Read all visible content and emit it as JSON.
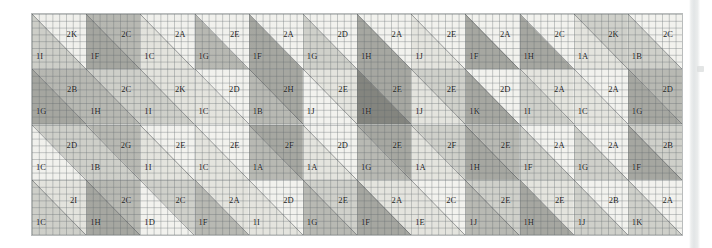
{
  "figure": {
    "kind": "quilt-layout-grid",
    "rows": 4,
    "columns": 12,
    "upper_label_prefix": "2",
    "lower_label_prefix": "1",
    "grid_line_color": "#60686c",
    "border_color": "#b9bcbc",
    "paper_color": "#fbfbfa"
  },
  "shades": {
    "light": "#f2f2ee",
    "pale": "#e4e4de",
    "mid_light": "#cfd0ca",
    "mid": "#b8b9b3",
    "mid_dark": "#a6a7a1",
    "dark": "#93948e",
    "darker": "#84857f"
  },
  "cells": [
    [
      {
        "upper": "2K",
        "lower": "1I",
        "upper_shade": "light",
        "lower_shade": "mid_light"
      },
      {
        "upper": "2C",
        "lower": "1F",
        "upper_shade": "mid",
        "lower_shade": "mid_dark"
      },
      {
        "upper": "2A",
        "lower": "1C",
        "upper_shade": "light",
        "lower_shade": "pale"
      },
      {
        "upper": "2E",
        "lower": "1G",
        "upper_shade": "light",
        "lower_shade": "mid"
      },
      {
        "upper": "2A",
        "lower": "1F",
        "upper_shade": "light",
        "lower_shade": "mid_dark"
      },
      {
        "upper": "2D",
        "lower": "1G",
        "upper_shade": "light",
        "lower_shade": "mid_light"
      },
      {
        "upper": "2A",
        "lower": "1H",
        "upper_shade": "light",
        "lower_shade": "mid_dark"
      },
      {
        "upper": "2E",
        "lower": "1J",
        "upper_shade": "light",
        "lower_shade": "pale"
      },
      {
        "upper": "2A",
        "lower": "1F",
        "upper_shade": "light",
        "lower_shade": "mid_dark"
      },
      {
        "upper": "2C",
        "lower": "1H",
        "upper_shade": "light",
        "lower_shade": "mid_dark"
      },
      {
        "upper": "2K",
        "lower": "1A",
        "upper_shade": "mid_light",
        "lower_shade": "pale"
      },
      {
        "upper": "2C",
        "lower": "1B",
        "upper_shade": "light",
        "lower_shade": "mid_light"
      }
    ],
    [
      {
        "upper": "2B",
        "lower": "1G",
        "upper_shade": "mid",
        "lower_shade": "mid_dark"
      },
      {
        "upper": "2C",
        "lower": "1H",
        "upper_shade": "mid_light",
        "lower_shade": "mid"
      },
      {
        "upper": "2K",
        "lower": "1I",
        "upper_shade": "pale",
        "lower_shade": "mid_light"
      },
      {
        "upper": "2D",
        "lower": "1C",
        "upper_shade": "light",
        "lower_shade": "pale"
      },
      {
        "upper": "2H",
        "lower": "1B",
        "upper_shade": "mid_dark",
        "lower_shade": "mid"
      },
      {
        "upper": "2E",
        "lower": "1J",
        "upper_shade": "pale",
        "lower_shade": "light"
      },
      {
        "upper": "2E",
        "lower": "1H",
        "upper_shade": "mid_dark",
        "lower_shade": "darker"
      },
      {
        "upper": "2E",
        "lower": "1J",
        "upper_shade": "mid_light",
        "lower_shade": "pale"
      },
      {
        "upper": "2D",
        "lower": "1K",
        "upper_shade": "light",
        "lower_shade": "mid_dark"
      },
      {
        "upper": "2A",
        "lower": "1I",
        "upper_shade": "pale",
        "lower_shade": "mid_light"
      },
      {
        "upper": "2A",
        "lower": "1C",
        "upper_shade": "light",
        "lower_shade": "pale"
      },
      {
        "upper": "2D",
        "lower": "1G",
        "upper_shade": "mid",
        "lower_shade": "mid_dark"
      }
    ],
    [
      {
        "upper": "2D",
        "lower": "1C",
        "upper_shade": "mid_light",
        "lower_shade": "light"
      },
      {
        "upper": "2G",
        "lower": "1B",
        "upper_shade": "mid",
        "lower_shade": "mid_light"
      },
      {
        "upper": "2E",
        "lower": "1I",
        "upper_shade": "light",
        "lower_shade": "pale"
      },
      {
        "upper": "2E",
        "lower": "1C",
        "upper_shade": "light",
        "lower_shade": "pale"
      },
      {
        "upper": "2F",
        "lower": "1A",
        "upper_shade": "mid_dark",
        "lower_shade": "mid"
      },
      {
        "upper": "2D",
        "lower": "1A",
        "upper_shade": "light",
        "lower_shade": "pale"
      },
      {
        "upper": "2E",
        "lower": "1G",
        "upper_shade": "mid_dark",
        "lower_shade": "mid"
      },
      {
        "upper": "2F",
        "lower": "1A",
        "upper_shade": "mid_light",
        "lower_shade": "pale"
      },
      {
        "upper": "2E",
        "lower": "1H",
        "upper_shade": "mid",
        "lower_shade": "mid_dark"
      },
      {
        "upper": "2A",
        "lower": "1F",
        "upper_shade": "light",
        "lower_shade": "mid_light"
      },
      {
        "upper": "2A",
        "lower": "1G",
        "upper_shade": "light",
        "lower_shade": "mid_light"
      },
      {
        "upper": "2B",
        "lower": "1F",
        "upper_shade": "mid_light",
        "lower_shade": "mid_dark"
      }
    ],
    [
      {
        "upper": "2I",
        "lower": "1C",
        "upper_shade": "pale",
        "lower_shade": "mid_light"
      },
      {
        "upper": "2C",
        "lower": "1H",
        "upper_shade": "mid",
        "lower_shade": "mid_dark"
      },
      {
        "upper": "2C",
        "lower": "1D",
        "upper_shade": "mid_light",
        "lower_shade": "light"
      },
      {
        "upper": "2A",
        "lower": "1F",
        "upper_shade": "pale",
        "lower_shade": "mid"
      },
      {
        "upper": "2D",
        "lower": "1I",
        "upper_shade": "light",
        "lower_shade": "pale"
      },
      {
        "upper": "2E",
        "lower": "1G",
        "upper_shade": "mid_light",
        "lower_shade": "mid"
      },
      {
        "upper": "2A",
        "lower": "1F",
        "upper_shade": "pale",
        "lower_shade": "mid_dark"
      },
      {
        "upper": "2C",
        "lower": "1E",
        "upper_shade": "light",
        "lower_shade": "pale"
      },
      {
        "upper": "2E",
        "lower": "1J",
        "upper_shade": "mid_light",
        "lower_shade": "mid"
      },
      {
        "upper": "2E",
        "lower": "1H",
        "upper_shade": "pale",
        "lower_shade": "mid_dark"
      },
      {
        "upper": "2B",
        "lower": "1J",
        "upper_shade": "light",
        "lower_shade": "mid_light"
      },
      {
        "upper": "2A",
        "lower": "1K",
        "upper_shade": "light",
        "lower_shade": "mid_light"
      }
    ]
  ]
}
